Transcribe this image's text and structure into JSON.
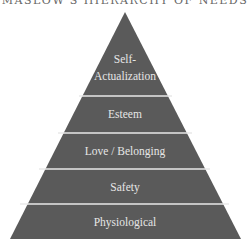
{
  "title": "MASLOW'S HIERARCHY OF NEEDS",
  "colors": {
    "fill": "#5a5a5a",
    "separator": "#e8e8e8",
    "text": "#e6e6e6"
  },
  "levels": [
    {
      "label_line1": "Self-",
      "label_line2": "Actualization"
    },
    {
      "label": "Esteem"
    },
    {
      "label": "Love / Belonging"
    },
    {
      "label": "Safety"
    },
    {
      "label": "Physiological"
    }
  ]
}
